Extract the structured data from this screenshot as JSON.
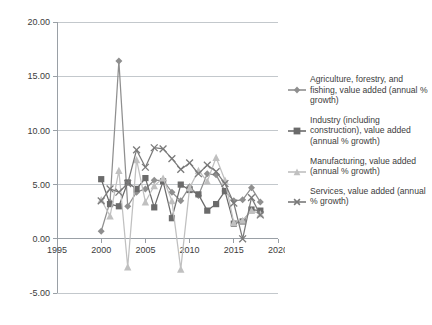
{
  "chart_data": {
    "type": "line",
    "title": "",
    "xlabel": "",
    "ylabel": "",
    "xlim": [
      1995,
      2020
    ],
    "ylim": [
      -5.0,
      20.0
    ],
    "grid": true,
    "legend_position": "right",
    "x_ticks": [
      "1995",
      "2000",
      "2005",
      "2010",
      "2015",
      "2020"
    ],
    "y_ticks": [
      "20.00",
      "15.00",
      "10.00",
      "5.00",
      "0.00",
      "-5.00"
    ],
    "x": [
      2000,
      2001,
      2002,
      2003,
      2004,
      2005,
      2006,
      2007,
      2008,
      2009,
      2010,
      2011,
      2012,
      2013,
      2014,
      2015,
      2016,
      2017,
      2018
    ],
    "series": [
      {
        "name": "Agriculture, forestry, and fishing, value added (annual % growth)",
        "marker": "diamond",
        "color": "#8f8f8f",
        "values": [
          0.7,
          3.4,
          16.4,
          3.0,
          4.3,
          4.6,
          5.4,
          5.4,
          4.3,
          3.5,
          4.8,
          4.0,
          6.0,
          5.9,
          4.4,
          3.5,
          3.6,
          4.7,
          3.4
        ]
      },
      {
        "name": "Industry (including construction), value added (annual % growth)",
        "marker": "square",
        "color": "#6b6b6b",
        "values": [
          5.5,
          3.2,
          3.0,
          5.2,
          4.6,
          5.6,
          2.9,
          5.3,
          1.9,
          5.0,
          4.5,
          4.1,
          2.6,
          3.2,
          4.4,
          1.4,
          1.6,
          2.7,
          2.6
        ]
      },
      {
        "name": "Manufacturing, value added (annual % growth)",
        "marker": "triangle",
        "color": "#c0c0c0",
        "values": [
          3.6,
          2.1,
          6.3,
          -2.6,
          7.3,
          3.4,
          4.9,
          5.6,
          3.5,
          -2.8,
          4.7,
          6.3,
          5.3,
          7.5,
          5.4,
          1.5,
          1.7,
          2.6,
          2.3
        ]
      },
      {
        "name": "Services, value added (annual % growth)",
        "marker": "cross",
        "color": "#7a7a7a",
        "values": [
          3.5,
          4.6,
          4.3,
          5.1,
          8.2,
          6.6,
          8.4,
          8.3,
          7.4,
          6.4,
          7.0,
          6.0,
          6.8,
          6.2,
          5.1,
          3.3,
          0.0,
          3.8,
          2.2
        ]
      }
    ]
  },
  "legend": {
    "items": [
      {
        "label": "Agriculture, forestry, and fishing, value added (annual % growth)"
      },
      {
        "label": "Industry (including construction), value added (annual % growth)"
      },
      {
        "label": "Manufacturing, value added (annual % growth)"
      },
      {
        "label": "Services, value added (annual % growth)"
      }
    ]
  }
}
